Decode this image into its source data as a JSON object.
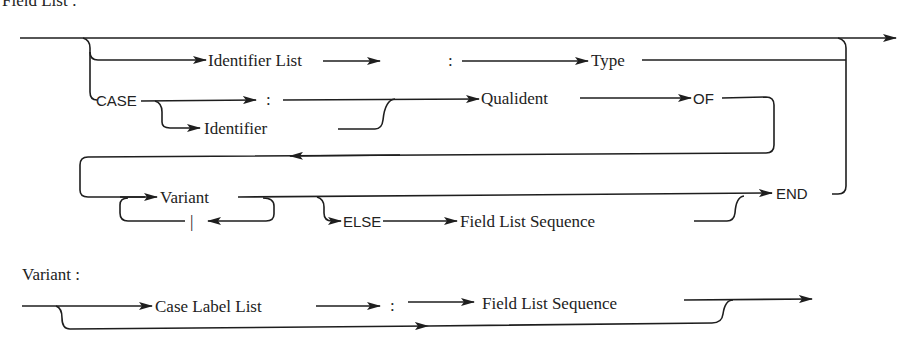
{
  "diagrams": [
    {
      "title": "Field List :",
      "nodes": {
        "identifier_list": "Identifier List",
        "colon1": ":",
        "type": "Type",
        "case": "CASE",
        "colon2": ":",
        "identifier": "Identifier",
        "qualident": "Qualident",
        "of": "OF",
        "variant": "Variant",
        "bar": "|",
        "else": "ELSE",
        "field_list_sequence": "Field List Sequence",
        "end": "END"
      }
    },
    {
      "title": "Variant :",
      "nodes": {
        "case_label_list": "Case Label List",
        "colon": ":",
        "field_list_sequence": "Field List Sequence"
      }
    }
  ],
  "colors": {
    "ink": "#1e1e1e",
    "background": "#ffffff"
  }
}
